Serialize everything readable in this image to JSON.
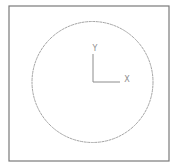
{
  "viewport": {
    "background": "#ffffff",
    "frame": {
      "x": 9,
      "y": 6,
      "width": 160,
      "height": 155,
      "stroke": "#7a7a7a",
      "stroke_width": 1.2
    }
  },
  "drawing": {
    "circle": {
      "cx": 92.5,
      "cy": 82,
      "r": 60.5,
      "stroke": "#a4a4a4",
      "stroke_width": 1,
      "dash": "3 0.6"
    }
  },
  "ucs_icon": {
    "origin": {
      "x": 93,
      "y": 82
    },
    "y_axis_end": {
      "x": 93,
      "y": 54
    },
    "x_axis_end": {
      "x": 120,
      "y": 82
    },
    "stroke": "#8c8c8c",
    "y_label": "Y",
    "x_label": "X",
    "y_label_pos": {
      "x": 95,
      "y": 51
    },
    "x_label_pos": {
      "x": 127,
      "y": 82
    }
  }
}
